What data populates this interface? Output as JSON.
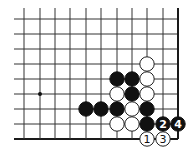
{
  "diagram": {
    "type": "go-board-partial",
    "view": "bottom-right corner",
    "board": {
      "columns_x": [
        24,
        40,
        55,
        70,
        86,
        101,
        117,
        132,
        147,
        163,
        178
      ],
      "rows_y": [
        19,
        34,
        49,
        64,
        79,
        94,
        109,
        124,
        139
      ],
      "line_start_x": 14,
      "line_start_y": 8,
      "right_edge": true,
      "bottom_edge": true,
      "stone_radius": 7.2
    },
    "star_points": [
      {
        "col": 1,
        "row": 5
      }
    ],
    "stones": [
      {
        "color": "white",
        "col": 8,
        "row": 3,
        "label": ""
      },
      {
        "color": "black",
        "col": 6,
        "row": 4,
        "label": ""
      },
      {
        "color": "black",
        "col": 7,
        "row": 4,
        "label": ""
      },
      {
        "color": "white",
        "col": 8,
        "row": 4,
        "label": ""
      },
      {
        "color": "white",
        "col": 6,
        "row": 5,
        "label": ""
      },
      {
        "color": "black",
        "col": 7,
        "row": 5,
        "label": ""
      },
      {
        "color": "white",
        "col": 8,
        "row": 5,
        "label": ""
      },
      {
        "color": "black",
        "col": 4,
        "row": 6,
        "label": ""
      },
      {
        "color": "black",
        "col": 5,
        "row": 6,
        "label": ""
      },
      {
        "color": "black",
        "col": 6,
        "row": 6,
        "label": ""
      },
      {
        "color": "white",
        "col": 7,
        "row": 6,
        "label": ""
      },
      {
        "color": "black",
        "col": 8,
        "row": 6,
        "label": ""
      },
      {
        "color": "white",
        "col": 6,
        "row": 7,
        "label": ""
      },
      {
        "color": "white",
        "col": 7,
        "row": 7,
        "label": ""
      },
      {
        "color": "black",
        "col": 8,
        "row": 7,
        "label": ""
      },
      {
        "color": "black",
        "col": 9,
        "row": 7,
        "label": "2"
      },
      {
        "color": "black",
        "col": 10,
        "row": 7,
        "label": "4"
      },
      {
        "color": "white",
        "col": 8,
        "row": 8,
        "label": "1"
      },
      {
        "color": "white",
        "col": 9,
        "row": 8,
        "label": "3"
      }
    ],
    "move_sequence": [
      "1",
      "2",
      "3",
      "4"
    ]
  }
}
